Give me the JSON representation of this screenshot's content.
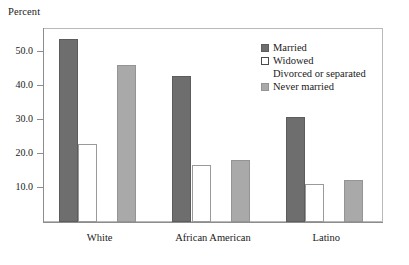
{
  "chart_data": {
    "type": "bar",
    "title": "",
    "subtitle": "",
    "xlabel": "",
    "ylabel": "Percent",
    "categories": [
      "White",
      "African American",
      "Latino"
    ],
    "series": [
      {
        "name": "Married",
        "color": "#6e6e6e",
        "values": [
          53.9,
          42.8,
          30.9
        ]
      },
      {
        "name": "Widowed",
        "color": "#ffffff",
        "values": [
          22.9,
          16.8,
          11.2
        ]
      },
      {
        "name": "Divorced or separated",
        "color": "#171717",
        "values": [
          30.5,
          20.9,
          10.0
        ]
      },
      {
        "name": "Never married",
        "color": "#a9a9a9",
        "values": [
          46.0,
          18.3,
          12.4
        ]
      }
    ],
    "ylim": [
      0,
      57
    ],
    "yticks": [
      10.0,
      20.0,
      30.0,
      40.0,
      50.0
    ],
    "ytick_labels": [
      "10.0",
      "20.0",
      "30.0",
      "40.0",
      "50.0"
    ],
    "grid": false,
    "legend_position": "top-right",
    "legend_entries": [
      "Married",
      "Widowed",
      "Divorced or separated",
      "Never married"
    ]
  }
}
